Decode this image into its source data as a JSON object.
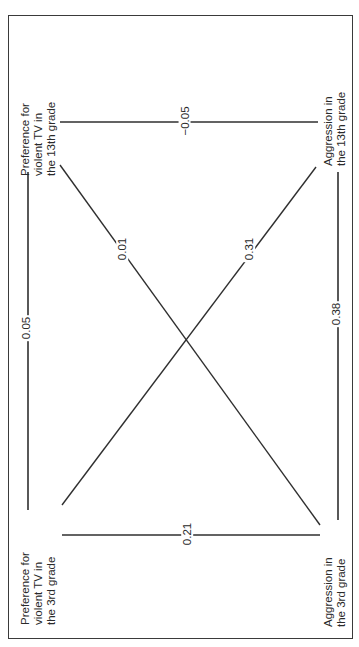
{
  "diagram": {
    "title": "",
    "orientation": "rotated-90-ccw",
    "caption_fragment": "",
    "colors": {
      "line": "#2f2f2f",
      "background": "#ffffff",
      "border": "#3a3a3a"
    },
    "nodes": [
      {
        "id": "pref_13",
        "lines": [
          "Preference for",
          "violent TV in",
          "the 13th grade"
        ]
      },
      {
        "id": "aggr_13",
        "lines": [
          "Aggression in",
          "the 13th grade"
        ]
      },
      {
        "id": "pref_3",
        "lines": [
          "Preference for",
          "violent TV in",
          "the 3rd grade"
        ]
      },
      {
        "id": "aggr_3",
        "lines": [
          "Aggression in",
          "the 3rd grade"
        ]
      }
    ],
    "edges": [
      {
        "from": "pref_3",
        "to": "pref_13",
        "label": "0.05"
      },
      {
        "from": "aggr_3",
        "to": "aggr_13",
        "label": "0.38"
      },
      {
        "from": "pref_13",
        "to": "aggr_13",
        "label": "−0.05"
      },
      {
        "from": "pref_3",
        "to": "aggr_3",
        "label": "0.21"
      },
      {
        "from": "pref_13",
        "to": "aggr_3",
        "label": "0.01"
      },
      {
        "from": "pref_3",
        "to": "aggr_13",
        "label": "0.31"
      }
    ]
  }
}
